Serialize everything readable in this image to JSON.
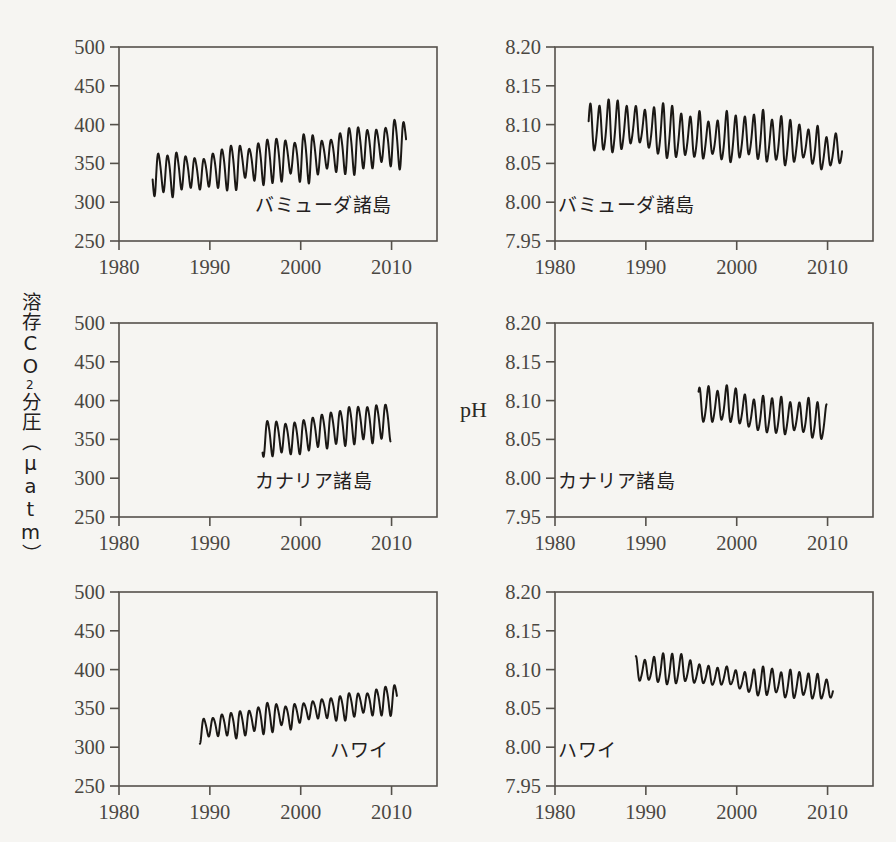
{
  "figure": {
    "background_color": "#f6f5f2",
    "axis_color": "#55514b",
    "curve_color": "#1b1815",
    "ylabel_left_lines": [
      "溶",
      "存",
      "C",
      "O",
      "2",
      "分",
      "圧",
      "（",
      "μ",
      "a",
      "t",
      "m",
      "）"
    ],
    "ylabel_left_text": "溶存CO2分圧（μatm）",
    "ylabel_right_text": "pH"
  },
  "chart_data": [
    {
      "type": "line",
      "id": "bermuda-pco2",
      "title": "",
      "annotation": "バミューダ諸島",
      "annotation_position": "bottom-right",
      "xlabel": "",
      "ylabel": "溶存CO2分圧（μatm）",
      "xlim": [
        1980,
        2015
      ],
      "ylim": [
        250,
        500
      ],
      "xticks": [
        1980,
        1990,
        2000,
        2010
      ],
      "yticks": [
        250,
        300,
        350,
        400,
        450,
        500
      ],
      "xtick_labels": [
        "1980",
        "1990",
        "2000",
        "2010"
      ],
      "ytick_labels": [
        "250",
        "300",
        "350",
        "400",
        "450",
        "500"
      ],
      "grid": false,
      "legend": "none",
      "data_start_year": 1983.7,
      "data_end_year": 2011.6,
      "seasonal_cycle": true,
      "series": [
        {
          "name": "pCO2 Bermuda (BATS)",
          "description": "Monthly seawater pCO2 with strong annual cycle and rising trend",
          "annual_mean_trend": [
            {
              "year": 1984,
              "value": 338
            },
            {
              "year": 1985,
              "value": 337
            },
            {
              "year": 1986,
              "value": 338
            },
            {
              "year": 1987,
              "value": 340
            },
            {
              "year": 1988,
              "value": 340
            },
            {
              "year": 1989,
              "value": 336
            },
            {
              "year": 1990,
              "value": 342
            },
            {
              "year": 1991,
              "value": 344
            },
            {
              "year": 1992,
              "value": 345
            },
            {
              "year": 1993,
              "value": 348
            },
            {
              "year": 1994,
              "value": 351
            },
            {
              "year": 1995,
              "value": 352
            },
            {
              "year": 1996,
              "value": 353
            },
            {
              "year": 1997,
              "value": 355
            },
            {
              "year": 1998,
              "value": 357
            },
            {
              "year": 1999,
              "value": 356
            },
            {
              "year": 2000,
              "value": 358
            },
            {
              "year": 2001,
              "value": 359
            },
            {
              "year": 2002,
              "value": 360
            },
            {
              "year": 2003,
              "value": 362
            },
            {
              "year": 2004,
              "value": 364
            },
            {
              "year": 2005,
              "value": 367
            },
            {
              "year": 2006,
              "value": 369
            },
            {
              "year": 2007,
              "value": 370
            },
            {
              "year": 2008,
              "value": 371
            },
            {
              "year": 2009,
              "value": 373
            },
            {
              "year": 2010,
              "value": 378
            },
            {
              "year": 2011,
              "value": 376
            }
          ],
          "amplitude_range": [
            30,
            66
          ],
          "min_observed": 274,
          "max_observed": 450
        }
      ]
    },
    {
      "type": "line",
      "id": "bermuda-ph",
      "title": "",
      "annotation": "バミューダ諸島",
      "annotation_position": "bottom-left",
      "xlabel": "",
      "ylabel": "pH",
      "xlim": [
        1980,
        2015
      ],
      "ylim": [
        7.95,
        8.2
      ],
      "xticks": [
        1980,
        1990,
        2000,
        2010
      ],
      "yticks": [
        7.95,
        8.0,
        8.05,
        8.1,
        8.15,
        8.2
      ],
      "xtick_labels": [
        "1980",
        "1990",
        "2000",
        "2010"
      ],
      "ytick_labels": [
        "7.95",
        "8.00",
        "8.05",
        "8.10",
        "8.15",
        "8.20"
      ],
      "grid": false,
      "legend": "none",
      "data_start_year": 1983.7,
      "data_end_year": 2011.6,
      "seasonal_cycle": true,
      "series": [
        {
          "name": "pH Bermuda (BATS)",
          "description": "Monthly seawater pH with annual cycle and declining trend",
          "annual_mean_trend": [
            {
              "year": 1984,
              "value": 8.094
            },
            {
              "year": 1985,
              "value": 8.095
            },
            {
              "year": 1986,
              "value": 8.096
            },
            {
              "year": 1987,
              "value": 8.096
            },
            {
              "year": 1988,
              "value": 8.097
            },
            {
              "year": 1989,
              "value": 8.1
            },
            {
              "year": 1990,
              "value": 8.094
            },
            {
              "year": 1991,
              "value": 8.092
            },
            {
              "year": 1992,
              "value": 8.09
            },
            {
              "year": 1993,
              "value": 8.088
            },
            {
              "year": 1994,
              "value": 8.085
            },
            {
              "year": 1995,
              "value": 8.084
            },
            {
              "year": 1996,
              "value": 8.083
            },
            {
              "year": 1997,
              "value": 8.082
            },
            {
              "year": 1998,
              "value": 8.08
            },
            {
              "year": 1999,
              "value": 8.082
            },
            {
              "year": 2000,
              "value": 8.081
            },
            {
              "year": 2001,
              "value": 8.085
            },
            {
              "year": 2002,
              "value": 8.084
            },
            {
              "year": 2003,
              "value": 8.082
            },
            {
              "year": 2004,
              "value": 8.08
            },
            {
              "year": 2005,
              "value": 8.077
            },
            {
              "year": 2006,
              "value": 8.075
            },
            {
              "year": 2007,
              "value": 8.078
            },
            {
              "year": 2008,
              "value": 8.072
            },
            {
              "year": 2009,
              "value": 8.068
            },
            {
              "year": 2010,
              "value": 8.062
            },
            {
              "year": 2011,
              "value": 8.07
            }
          ],
          "amplitude_range": [
            0.035,
            0.07
          ],
          "min_observed": 7.998,
          "max_observed": 8.178
        }
      ]
    },
    {
      "type": "line",
      "id": "canary-pco2",
      "title": "",
      "annotation": "カナリア諸島",
      "annotation_position": "bottom-right",
      "xlabel": "",
      "ylabel": "溶存CO2分圧（μatm）",
      "xlim": [
        1980,
        2015
      ],
      "ylim": [
        250,
        500
      ],
      "xticks": [
        1980,
        1990,
        2000,
        2010
      ],
      "yticks": [
        250,
        300,
        350,
        400,
        450,
        500
      ],
      "xtick_labels": [
        "1980",
        "1990",
        "2000",
        "2010"
      ],
      "ytick_labels": [
        "250",
        "300",
        "350",
        "400",
        "450",
        "500"
      ],
      "grid": false,
      "legend": "none",
      "data_start_year": 1995.8,
      "data_end_year": 2009.9,
      "seasonal_cycle": true,
      "series": [
        {
          "name": "pCO2 Canary (ESTOC)",
          "description": "Monthly seawater pCO2 with annual cycle and rising trend",
          "annual_mean_trend": [
            {
              "year": 1996,
              "value": 352
            },
            {
              "year": 1997,
              "value": 353
            },
            {
              "year": 1998,
              "value": 353
            },
            {
              "year": 1999,
              "value": 352
            },
            {
              "year": 2000,
              "value": 354
            },
            {
              "year": 2001,
              "value": 358
            },
            {
              "year": 2002,
              "value": 362
            },
            {
              "year": 2003,
              "value": 363
            },
            {
              "year": 2004,
              "value": 366
            },
            {
              "year": 2005,
              "value": 368
            },
            {
              "year": 2006,
              "value": 370
            },
            {
              "year": 2007,
              "value": 372
            },
            {
              "year": 2008,
              "value": 371
            },
            {
              "year": 2009,
              "value": 374
            }
          ],
          "amplitude_range": [
            34,
            50
          ],
          "min_observed": 320,
          "max_observed": 405
        }
      ]
    },
    {
      "type": "line",
      "id": "canary-ph",
      "title": "",
      "annotation": "カナリア諸島",
      "annotation_position": "bottom-left",
      "xlabel": "",
      "ylabel": "pH",
      "xlim": [
        1980,
        2015
      ],
      "ylim": [
        7.95,
        8.2
      ],
      "xticks": [
        1980,
        1990,
        2000,
        2010
      ],
      "yticks": [
        7.95,
        8.0,
        8.05,
        8.1,
        8.15,
        8.2
      ],
      "xtick_labels": [
        "1980",
        "1990",
        "2000",
        "2010"
      ],
      "ytick_labels": [
        "7.95",
        "8.00",
        "8.05",
        "8.10",
        "8.15",
        "8.20"
      ],
      "grid": false,
      "legend": "none",
      "data_start_year": 1995.8,
      "data_end_year": 2009.9,
      "seasonal_cycle": true,
      "series": [
        {
          "name": "pH Canary (ESTOC)",
          "description": "Monthly seawater pH with annual cycle and declining trend",
          "annual_mean_trend": [
            {
              "year": 1996,
              "value": 8.094
            },
            {
              "year": 1997,
              "value": 8.093
            },
            {
              "year": 1998,
              "value": 8.093
            },
            {
              "year": 1999,
              "value": 8.095
            },
            {
              "year": 2000,
              "value": 8.092
            },
            {
              "year": 2001,
              "value": 8.086
            },
            {
              "year": 2002,
              "value": 8.081
            },
            {
              "year": 2003,
              "value": 8.081
            },
            {
              "year": 2004,
              "value": 8.08
            },
            {
              "year": 2005,
              "value": 8.078
            },
            {
              "year": 2006,
              "value": 8.078
            },
            {
              "year": 2007,
              "value": 8.079
            },
            {
              "year": 2008,
              "value": 8.077
            },
            {
              "year": 2009,
              "value": 8.072
            }
          ],
          "amplitude_range": [
            0.03,
            0.05
          ],
          "min_observed": 8.044,
          "max_observed": 8.131
        }
      ]
    },
    {
      "type": "line",
      "id": "hawaii-pco2",
      "title": "",
      "annotation": "ハワイ",
      "annotation_position": "bottom-right",
      "xlabel": "",
      "ylabel": "溶存CO2分圧（μatm）",
      "xlim": [
        1980,
        2015
      ],
      "ylim": [
        250,
        500
      ],
      "xticks": [
        1980,
        1990,
        2000,
        2010
      ],
      "yticks": [
        250,
        300,
        350,
        400,
        450,
        500
      ],
      "xtick_labels": [
        "1980",
        "1990",
        "2000",
        "2010"
      ],
      "ytick_labels": [
        "250",
        "300",
        "350",
        "400",
        "450",
        "500"
      ],
      "grid": false,
      "legend": "none",
      "data_start_year": 1988.9,
      "data_end_year": 2010.6,
      "seasonal_cycle": true,
      "series": [
        {
          "name": "pCO2 Hawaii (HOT/ALOHA)",
          "description": "Monthly seawater pCO2 with small annual cycle and rising trend",
          "annual_mean_trend": [
            {
              "year": 1989,
              "value": 322
            },
            {
              "year": 1990,
              "value": 326
            },
            {
              "year": 1991,
              "value": 329
            },
            {
              "year": 1992,
              "value": 330
            },
            {
              "year": 1993,
              "value": 330
            },
            {
              "year": 1994,
              "value": 332
            },
            {
              "year": 1995,
              "value": 336
            },
            {
              "year": 1996,
              "value": 338
            },
            {
              "year": 1997,
              "value": 340
            },
            {
              "year": 1998,
              "value": 341
            },
            {
              "year": 1999,
              "value": 340
            },
            {
              "year": 2000,
              "value": 345
            },
            {
              "year": 2001,
              "value": 348
            },
            {
              "year": 2002,
              "value": 350
            },
            {
              "year": 2003,
              "value": 351
            },
            {
              "year": 2004,
              "value": 350
            },
            {
              "year": 2005,
              "value": 353
            },
            {
              "year": 2006,
              "value": 356
            },
            {
              "year": 2007,
              "value": 357
            },
            {
              "year": 2008,
              "value": 358
            },
            {
              "year": 2009,
              "value": 360
            },
            {
              "year": 2010,
              "value": 362
            }
          ],
          "amplitude_range": [
            20,
            40
          ],
          "min_observed": 298,
          "max_observed": 388
        }
      ]
    },
    {
      "type": "line",
      "id": "hawaii-ph",
      "title": "",
      "annotation": "ハワイ",
      "annotation_position": "bottom-left",
      "xlabel": "",
      "ylabel": "pH",
      "xlim": [
        1980,
        2015
      ],
      "ylim": [
        7.95,
        8.2
      ],
      "xticks": [
        1980,
        1990,
        2000,
        2010
      ],
      "yticks": [
        7.95,
        8.0,
        8.05,
        8.1,
        8.15,
        8.2
      ],
      "xtick_labels": [
        "1980",
        "1990",
        "2000",
        "2010"
      ],
      "ytick_labels": [
        "7.95",
        "8.00",
        "8.05",
        "8.10",
        "8.15",
        "8.20"
      ],
      "grid": false,
      "legend": "none",
      "data_start_year": 1988.9,
      "data_end_year": 2010.6,
      "seasonal_cycle": true,
      "series": [
        {
          "name": "pH Hawaii (HOT/ALOHA)",
          "description": "Monthly seawater pH with annual cycle and declining trend",
          "annual_mean_trend": [
            {
              "year": 1989,
              "value": 8.1
            },
            {
              "year": 1990,
              "value": 8.099
            },
            {
              "year": 1991,
              "value": 8.1
            },
            {
              "year": 1992,
              "value": 8.1
            },
            {
              "year": 1993,
              "value": 8.099
            },
            {
              "year": 1994,
              "value": 8.102
            },
            {
              "year": 1995,
              "value": 8.096
            },
            {
              "year": 1996,
              "value": 8.094
            },
            {
              "year": 1997,
              "value": 8.092
            },
            {
              "year": 1998,
              "value": 8.09
            },
            {
              "year": 1999,
              "value": 8.093
            },
            {
              "year": 2000,
              "value": 8.087
            },
            {
              "year": 2001,
              "value": 8.084
            },
            {
              "year": 2002,
              "value": 8.083
            },
            {
              "year": 2003,
              "value": 8.083
            },
            {
              "year": 2004,
              "value": 8.086
            },
            {
              "year": 2005,
              "value": 8.08
            },
            {
              "year": 2006,
              "value": 8.079
            },
            {
              "year": 2007,
              "value": 8.082
            },
            {
              "year": 2008,
              "value": 8.078
            },
            {
              "year": 2009,
              "value": 8.077
            },
            {
              "year": 2010,
              "value": 8.075
            }
          ],
          "amplitude_range": [
            0.02,
            0.042
          ],
          "min_observed": 8.058,
          "max_observed": 8.146
        }
      ]
    }
  ]
}
